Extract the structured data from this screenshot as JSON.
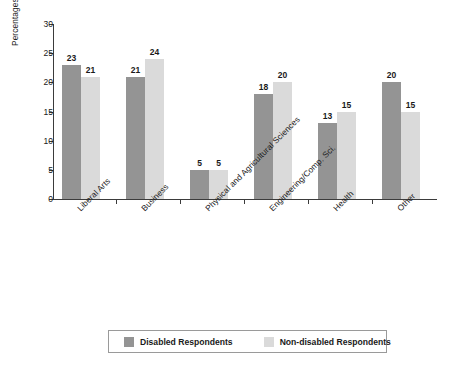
{
  "chart_data": {
    "type": "bar",
    "title": "",
    "xlabel": "",
    "ylabel": "Percentages by Field of Study",
    "ylim": [
      0,
      30
    ],
    "yticks": [
      0,
      5,
      10,
      15,
      20,
      25,
      30
    ],
    "grid": false,
    "legend_position": "bottom",
    "categories": [
      "Liberal Arts",
      "Business",
      "Physical and Agricultural Sciences",
      "Engineering/Comp. Sci.",
      "Health",
      "Other"
    ],
    "series": [
      {
        "name": "Disabled Respondents",
        "color": "#949494",
        "values": [
          23,
          21,
          5,
          18,
          13,
          20
        ]
      },
      {
        "name": "Non-disabled Respondents",
        "color": "#dadada",
        "values": [
          21,
          24,
          5,
          20,
          15,
          15
        ]
      }
    ]
  },
  "axis": {
    "y_title": "Percentages by Field of Study",
    "tick_labels": [
      "0",
      "5",
      "10",
      "15",
      "20",
      "25",
      "30"
    ]
  },
  "legend": {
    "items": [
      {
        "label": "Disabled Respondents",
        "color": "#949494"
      },
      {
        "label": "Non-disabled Respondents",
        "color": "#dadada"
      }
    ]
  },
  "colors": {
    "series_dark": "#949494",
    "series_light": "#dadada",
    "axis": "#3b3b3b",
    "text": "#1a1a1a",
    "background": "#ffffff"
  }
}
